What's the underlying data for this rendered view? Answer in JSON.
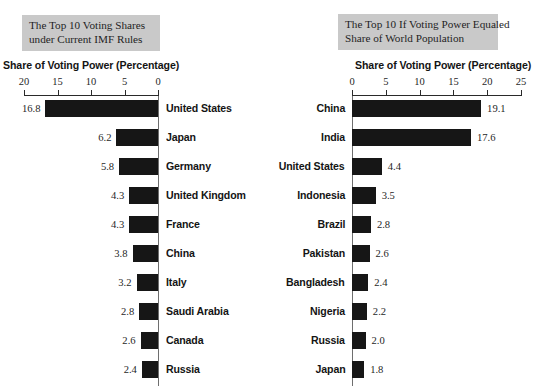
{
  "chart_data": [
    {
      "type": "bar",
      "orientation": "horizontal",
      "panel": "left",
      "title": "The Top 10 Voting Shares under Current IMF Rules",
      "title_lines": [
        "The Top 10 Voting Shares",
        "under Current IMF Rules"
      ],
      "xlabel": "Share of Voting Power (Percentage)",
      "ylabel": "",
      "xlim": [
        20,
        0
      ],
      "axis_reversed": true,
      "xticks": [
        20,
        15,
        10,
        5,
        0
      ],
      "xtick_labels": [
        "20",
        "15",
        "10",
        "5",
        "0"
      ],
      "grid": false,
      "legend": "none",
      "bar_color": "#161616",
      "categories": [
        "United States",
        "Japan",
        "Germany",
        "United Kingdom",
        "France",
        "China",
        "Italy",
        "Saudi Arabia",
        "Canada",
        "Russia"
      ],
      "values": [
        16.8,
        6.2,
        5.8,
        4.3,
        4.3,
        3.8,
        3.2,
        2.8,
        2.6,
        2.4
      ],
      "value_labels": [
        "16.8",
        "6.2",
        "5.8",
        "4.3",
        "4.3",
        "3.8",
        "3.2",
        "2.8",
        "2.6",
        "2.4"
      ]
    },
    {
      "type": "bar",
      "orientation": "horizontal",
      "panel": "right",
      "title": "The Top 10 If Voting Power Equaled Share of World Population",
      "title_lines": [
        "The Top 10 If  Voting Power Equaled",
        "Share of  World Population"
      ],
      "xlabel": "Share of Voting Power (Percentage)",
      "ylabel": "",
      "xlim": [
        0,
        25
      ],
      "axis_reversed": false,
      "xticks": [
        0,
        5,
        10,
        15,
        20,
        25
      ],
      "xtick_labels": [
        "0",
        "5",
        "10",
        "15",
        "20",
        "25"
      ],
      "grid": false,
      "legend": "none",
      "bar_color": "#161616",
      "categories": [
        "China",
        "India",
        "United States",
        "Indonesia",
        "Brazil",
        "Pakistan",
        "Bangladesh",
        "Nigeria",
        "Russia",
        "Japan"
      ],
      "values": [
        19.1,
        17.6,
        4.4,
        3.5,
        2.8,
        2.6,
        2.4,
        2.2,
        2.0,
        1.8
      ],
      "value_labels": [
        "19.1",
        "17.6",
        "4.4",
        "3.5",
        "2.8",
        "2.6",
        "2.4",
        "2.2",
        "2.0",
        "1.8"
      ]
    }
  ],
  "colors": {
    "bar": "#161616",
    "title_background": "#c9c9c9",
    "axis": "#2a2a2a",
    "baseline": "#6e6e6e",
    "page_background": "#ffffff"
  }
}
